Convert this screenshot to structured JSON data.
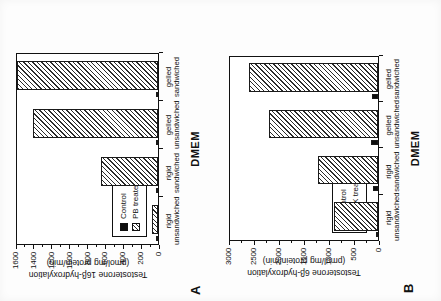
{
  "figure": {
    "group_label": "DMEM",
    "categories": [
      "rigid unsandwiched",
      "rigid sandwiched",
      "gelled unsandwiched",
      "gelled sandwiched"
    ],
    "category_lines": [
      [
        "rigid",
        "unsandwiched"
      ],
      [
        "rigid",
        "sandwiched"
      ],
      [
        "gelled",
        "unsandwiched"
      ],
      [
        "gelled",
        "sandwiched"
      ]
    ]
  },
  "panelA": {
    "letter": "A",
    "chart_data": {
      "type": "bar",
      "title": "",
      "xlabel": "DMEM",
      "ylabel": "Testosterone 16β-hydroxylation (pmol/mg protein/min)",
      "ylabel_line1": "Testosterone 16β-hydroxylation",
      "ylabel_line2": "(pmol/mg protein/min)",
      "categories": [
        "rigid unsandwiched",
        "rigid sandwiched",
        "gelled unsandwiched",
        "gelled sandwiched"
      ],
      "ylim": [
        0,
        1600
      ],
      "yticks": [
        0,
        200,
        400,
        600,
        800,
        1000,
        1200,
        1400,
        1600
      ],
      "ytick_labels": [
        "0",
        "200",
        "400",
        "600",
        "800",
        "1000",
        "1200",
        "1400",
        "1600"
      ],
      "grid": false,
      "legend_position": "lower-left",
      "series": [
        {
          "name": "Control",
          "style": "solid-black",
          "values": [
            8,
            12,
            14,
            16
          ]
        },
        {
          "name": "PB treated",
          "style": "hatched",
          "values": [
            70,
            640,
            1400,
            1580
          ]
        }
      ]
    },
    "legend": [
      {
        "label": "Control",
        "style": "control"
      },
      {
        "label": "PB treated",
        "style": "treated"
      }
    ]
  },
  "panelB": {
    "letter": "B",
    "chart_data": {
      "type": "bar",
      "title": "",
      "xlabel": "DMEM",
      "ylabel": "Testosterone 6β-hydroxylation (pmol/mg protein/min)",
      "ylabel_line1": "Testosterone 6β-hydroxylation",
      "ylabel_line2": "(pmol/mg protein/min)",
      "categories": [
        "rigid unsandwiched",
        "rigid sandwiched",
        "gelled unsandwiched",
        "gelled sandwiched"
      ],
      "ylim": [
        0,
        3000
      ],
      "yticks": [
        0,
        500,
        1000,
        1500,
        2000,
        2500,
        3000
      ],
      "ytick_labels": [
        "0",
        "500",
        "1000",
        "1500",
        "2000",
        "2500",
        "3000"
      ],
      "grid": false,
      "legend_position": "lower-left",
      "series": [
        {
          "name": "Control",
          "style": "solid-black",
          "values": [
            25,
            110,
            150,
            130
          ]
        },
        {
          "name": "DEX treated",
          "style": "hatched",
          "values": [
            880,
            1210,
            2180,
            2590
          ]
        }
      ]
    },
    "legend": [
      {
        "label": "Control",
        "style": "control"
      },
      {
        "label": "DEX treated",
        "style": "treated"
      }
    ]
  }
}
